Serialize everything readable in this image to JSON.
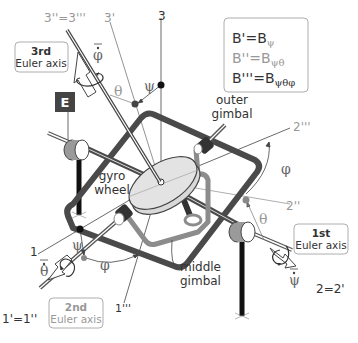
{
  "diagram": {
    "legend": {
      "rows": [
        {
          "lhs": "B'",
          "eq": "=",
          "base": "B",
          "sub": "ψ",
          "color": "#333333"
        },
        {
          "lhs": "B''",
          "eq": "=",
          "base": "B",
          "sub": "ψθ",
          "color": "#999999"
        },
        {
          "lhs": "B'''",
          "eq": "=",
          "base": "B",
          "sub": "ψθφ",
          "color": "#333333"
        }
      ]
    },
    "frame_badge": "E",
    "components": {
      "outer_gimbal": [
        "outer",
        "gimbal"
      ],
      "middle_gimbal": [
        "middle",
        "gimbal"
      ],
      "gyro_wheel": [
        "gyro",
        "wheel"
      ]
    },
    "euler_axes": {
      "first": {
        "line1": "1st",
        "line2": "Euler axis",
        "axis_label": "2=2'",
        "rate": "ψ̇"
      },
      "second": {
        "line1": "2nd",
        "line2": "Euler axis",
        "axis_label": "1'=1''",
        "rate": "θ̇"
      },
      "third": {
        "line1": "3rd",
        "line2": "Euler axis",
        "axis_label": "3''=3'''",
        "rate": "φ̇"
      }
    },
    "axis_labels": {
      "a3": "3",
      "a3p": "3'",
      "a3pp": "3''=3'''",
      "a1": "1",
      "a1ppp": "1'''",
      "a2pp": "2''",
      "a2ppp": "2'''",
      "a2": "2=2'",
      "a1p": "1'=1''"
    },
    "angles": {
      "psi": "ψ",
      "theta": "θ",
      "phi": "φ"
    },
    "colors": {
      "gimbal_dark": "#4a4a4a",
      "gimbal_mid": "#8c8c8c",
      "wheel_fill": "#d9d9d9",
      "badge_bg": "#444444",
      "text_dark": "#333333",
      "text_gray": "#999999"
    }
  }
}
